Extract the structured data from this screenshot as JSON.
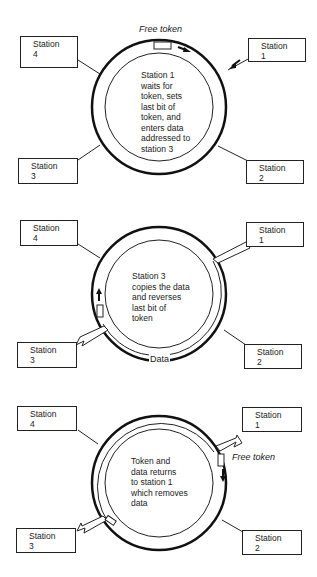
{
  "diagrams": [
    {
      "stations": [
        {
          "label": "Station",
          "num": "4"
        },
        {
          "label": "Station",
          "num": "1"
        },
        {
          "label": "Station",
          "num": "3"
        },
        {
          "label": "Station",
          "num": "2"
        }
      ],
      "top_label": "Free token",
      "center_lines": [
        "Station 1",
        "waits for",
        "token, sets",
        "last bit of",
        "token, and",
        "enters data",
        "addressed to",
        "station 3"
      ]
    },
    {
      "stations": [
        {
          "label": "Station",
          "num": "4"
        },
        {
          "label": "Station",
          "num": "1"
        },
        {
          "label": "Station",
          "num": "3"
        },
        {
          "label": "Station",
          "num": "2"
        }
      ],
      "data_label": "Data",
      "center_lines": [
        "Station 3",
        "copies the data",
        "and reverses",
        "last bit of",
        "token"
      ]
    },
    {
      "stations": [
        {
          "label": "Station",
          "num": "4"
        },
        {
          "label": "Station",
          "num": "1"
        },
        {
          "label": "Station",
          "num": "3"
        },
        {
          "label": "Station",
          "num": "2"
        }
      ],
      "side_label": "Free token",
      "center_lines": [
        "Token and",
        "data returns",
        "to station 1",
        "which removes",
        "data"
      ]
    }
  ]
}
